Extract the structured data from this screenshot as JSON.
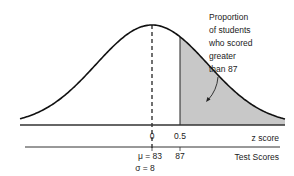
{
  "chart_data": {
    "type": "area",
    "title": "",
    "distribution": "normal",
    "mean": 83,
    "sd": 8,
    "shade_from_z": 0.5,
    "shade_from_score": 87,
    "shade_tail": "right",
    "z_axis": {
      "label": "z score",
      "ticks": [
        {
          "z": 0,
          "label": "0"
        },
        {
          "z": 0.5,
          "label": "0.5"
        }
      ]
    },
    "score_axis": {
      "label": "Test Scores",
      "ticks": [
        {
          "z": 0,
          "label": "μ = 83"
        },
        {
          "z": 0.5,
          "label": "87"
        }
      ],
      "sigma_label": "σ = 8"
    },
    "annotation": {
      "lines": [
        "Proportion",
        "of students",
        "who scored",
        "greater",
        "than 87"
      ]
    },
    "colors": {
      "curve": "#111111",
      "shade": "#c8c8c8",
      "axis": "#333333"
    }
  }
}
